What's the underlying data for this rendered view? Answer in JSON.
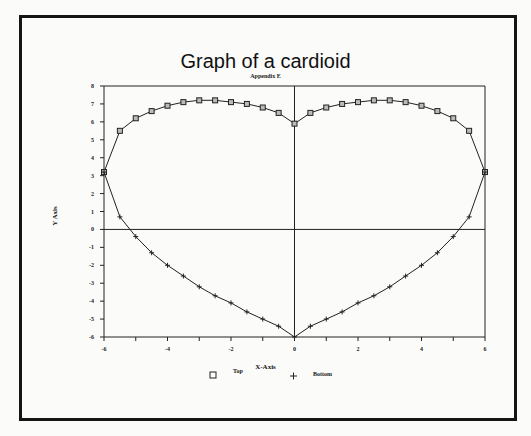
{
  "chart_data": {
    "type": "line",
    "title": "Graph of a cardioid",
    "subtitle": "Appendix E",
    "xlabel": "X-Axis",
    "ylabel": "Y Axis",
    "xlim": [
      -6,
      6
    ],
    "ylim": [
      -6,
      8
    ],
    "x_ticks": [
      "-6",
      "-4",
      "-2",
      "0",
      "2",
      "4",
      "6"
    ],
    "y_ticks": [
      "8",
      "7",
      "6",
      "5",
      "4",
      "3",
      "2",
      "1",
      "0",
      "-1",
      "-2",
      "-3",
      "-4",
      "-5",
      "-6"
    ],
    "grid": false,
    "legend_position": "bottom",
    "series": [
      {
        "name": "Top",
        "marker": "square",
        "x": [
          -6,
          -5.5,
          -5,
          -4.5,
          -4,
          -3.5,
          -3,
          -2.5,
          -2,
          -1.5,
          -1,
          -0.5,
          0,
          0.5,
          1,
          1.5,
          2,
          2.5,
          3,
          3.5,
          4,
          4.5,
          5,
          5.5,
          6
        ],
        "values": [
          3.2,
          5.5,
          6.2,
          6.6,
          6.9,
          7.1,
          7.2,
          7.2,
          7.1,
          7.0,
          6.8,
          6.5,
          5.9,
          6.5,
          6.8,
          7.0,
          7.1,
          7.2,
          7.2,
          7.1,
          6.9,
          6.6,
          6.2,
          5.5,
          3.2
        ]
      },
      {
        "name": "Bottom",
        "marker": "plus",
        "x": [
          -6,
          -5.5,
          -5,
          -4.5,
          -4,
          -3.5,
          -3,
          -2.5,
          -2,
          -1.5,
          -1,
          -0.5,
          0,
          0.5,
          1,
          1.5,
          2,
          2.5,
          3,
          3.5,
          4,
          4.5,
          5,
          5.5,
          6
        ],
        "values": [
          3.2,
          0.7,
          -0.4,
          -1.3,
          -2.0,
          -2.6,
          -3.2,
          -3.7,
          -4.1,
          -4.6,
          -5.0,
          -5.4,
          -6.0,
          -5.4,
          -5.0,
          -4.6,
          -4.1,
          -3.7,
          -3.2,
          -2.6,
          -2.0,
          -1.3,
          -0.4,
          0.7,
          3.2
        ]
      }
    ]
  },
  "legend": {
    "top_label": "Top",
    "bottom_label": "Bottom"
  }
}
